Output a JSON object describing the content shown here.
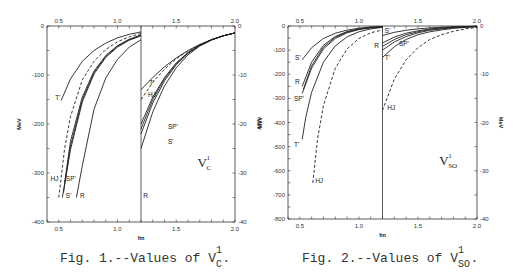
{
  "chart_data": [
    {
      "type": "line",
      "id": "fig1",
      "caption": {
        "prefix": "Fig. 1.--Values of V",
        "sup": "1",
        "sub": "C",
        "suffix": "."
      },
      "panel_label": {
        "main": "V",
        "sup": "1",
        "sub": "C"
      },
      "xlabel": "fm",
      "ylabel_left": "MeV",
      "ylabel_right": "MeV",
      "xlim": [
        0.4,
        2.0
      ],
      "x_break": 1.2,
      "ylim_left": [
        -400,
        0
      ],
      "ylim_right": [
        -40,
        0
      ],
      "x_ticks": [
        "0.5",
        "1.0",
        "1.5",
        "2.0"
      ],
      "x_tick_values": [
        0.5,
        1.0,
        1.5,
        2.0
      ],
      "y_ticks_left": [
        "0",
        "-100",
        "-200",
        "-300",
        "-400"
      ],
      "y_tick_values_left": [
        0,
        -100,
        -200,
        -300,
        -400
      ],
      "y_ticks_right": [
        "0",
        "-10",
        "-20",
        "-30",
        "-40"
      ],
      "y_tick_values_right": [
        0,
        -10,
        -20,
        -30,
        -40
      ],
      "series": [
        {
          "name": "T'",
          "style": "solid",
          "left": {
            "x": [
              0.52,
              0.6,
              0.7,
              0.8,
              0.9,
              1.0,
              1.1,
              1.2
            ],
            "y": [
              -152,
              -108,
              -72,
              -50,
              -35,
              -24,
              -17,
              -12
            ]
          },
          "right": {
            "x": [
              1.2,
              1.3,
              1.4,
              1.5,
              1.6,
              1.7,
              1.8,
              1.9,
              2.0
            ],
            "y": [
              -13,
              -10.5,
              -8.3,
              -6.5,
              -5,
              -3.8,
              -2.8,
              -2,
              -1.4
            ]
          }
        },
        {
          "name": "HJ",
          "style": "dashed",
          "left": {
            "x": [
              0.5,
              0.55,
              0.6,
              0.7,
              0.8,
              0.9,
              1.0,
              1.1,
              1.2
            ],
            "y": [
              -350,
              -250,
              -185,
              -110,
              -72,
              -48,
              -32,
              -22,
              -15
            ]
          },
          "right": {
            "x": [
              1.2,
              1.3,
              1.4,
              1.5,
              1.6,
              1.7,
              1.8,
              1.9,
              2.0
            ],
            "y": [
              -15,
              -11.5,
              -8.8,
              -6.7,
              -5.1,
              -3.8,
              -2.8,
              -2,
              -1.4
            ]
          }
        },
        {
          "name": "SP'",
          "style": "solid",
          "left": {
            "x": [
              0.55,
              0.6,
              0.7,
              0.8,
              0.9,
              1.0,
              1.1,
              1.2
            ],
            "y": [
              -320,
              -235,
              -145,
              -92,
              -60,
              -40,
              -27,
              -18
            ]
          },
          "right": {
            "x": [
              1.2,
              1.3,
              1.4,
              1.5,
              1.6,
              1.7,
              1.8,
              1.9,
              2.0
            ],
            "y": [
              -20,
              -14.5,
              -10.5,
              -7.5,
              -5.4,
              -3.9,
              -2.8,
              -2,
              -1.4
            ]
          }
        },
        {
          "name": "SP'-b",
          "style": "solid",
          "left": {
            "x": [
              0.54,
              0.6,
              0.7,
              0.8,
              0.9,
              1.0,
              1.1,
              1.2
            ],
            "y": [
              -340,
              -245,
              -150,
              -95,
              -62,
              -41,
              -28,
              -19
            ]
          },
          "right": {
            "x": [
              1.2,
              1.3,
              1.4,
              1.5,
              1.6,
              1.7,
              1.8,
              1.9,
              2.0
            ],
            "y": [
              -21,
              -15,
              -10.8,
              -7.7,
              -5.5,
              -3.9,
              -2.8,
              -2,
              -1.4
            ]
          }
        },
        {
          "name": "S'",
          "style": "solid",
          "left": {
            "x": [
              0.53,
              0.6,
              0.7,
              0.8,
              0.9,
              1.0,
              1.1,
              1.2
            ],
            "y": [
              -350,
              -252,
              -155,
              -98,
              -64,
              -43,
              -29,
              -20
            ]
          },
          "right": {
            "x": [
              1.2,
              1.3,
              1.4,
              1.5,
              1.6,
              1.7,
              1.8,
              1.9,
              2.0
            ],
            "y": [
              -22,
              -15.7,
              -11.2,
              -7.9,
              -5.6,
              -4,
              -2.8,
              -2,
              -1.4
            ]
          }
        },
        {
          "name": "R",
          "style": "solid",
          "left": {
            "x": [
              0.65,
              0.7,
              0.8,
              0.9,
              1.0,
              1.1,
              1.2
            ],
            "y": [
              -350,
              -285,
              -170,
              -106,
              -68,
              -43,
              -28
            ]
          },
          "right": {
            "x": [
              1.2,
              1.3,
              1.4,
              1.5,
              1.6,
              1.7,
              1.8,
              1.9,
              2.0
            ],
            "y": [
              -25,
              -17.5,
              -12.2,
              -8.5,
              -5.9,
              -4.1,
              -2.9,
              -2,
              -1.4
            ]
          }
        }
      ],
      "labels": [
        {
          "text": "T'",
          "panel": "left",
          "x": 0.47,
          "y": -150
        },
        {
          "text": "HJ",
          "panel": "left",
          "x": 0.43,
          "y": -316
        },
        {
          "text": "SP'",
          "panel": "left",
          "x": 0.56,
          "y": -316
        },
        {
          "text": "S'",
          "panel": "left",
          "x": 0.56,
          "y": -350
        },
        {
          "text": "R",
          "panel": "left",
          "x": 0.68,
          "y": -350
        },
        {
          "text": "T'",
          "panel": "right",
          "x": 1.27,
          "y": -12
        },
        {
          "text": "HJ",
          "panel": "right",
          "x": 1.26,
          "y": -14.5
        },
        {
          "text": "SP'",
          "panel": "right",
          "x": 1.43,
          "y": -21
        },
        {
          "text": "S'",
          "panel": "right",
          "x": 1.43,
          "y": -24
        },
        {
          "text": "R",
          "panel": "right",
          "x": 1.22,
          "y": -35
        }
      ]
    },
    {
      "type": "line",
      "id": "fig2",
      "caption": {
        "prefix": "Fig. 2.--Values of V",
        "sup": "1",
        "sub": "SO",
        "suffix": "."
      },
      "panel_label": {
        "main": "V",
        "sup": "1",
        "sub": "SO"
      },
      "xlabel": "fm",
      "ylabel_left": "MeV",
      "ylabel_right": "MeV",
      "xlim": [
        0.4,
        2.0
      ],
      "x_break": 1.2,
      "ylim_left": [
        -800,
        0
      ],
      "ylim_right": [
        -40,
        0
      ],
      "x_ticks": [
        "0.5",
        "1.0",
        "1.5",
        "2.0"
      ],
      "x_tick_values": [
        0.5,
        1.0,
        1.5,
        2.0
      ],
      "y_ticks_left": [
        "0",
        "-100",
        "-200",
        "-300",
        "-400",
        "-500",
        "-600",
        "-700",
        "-800"
      ],
      "y_tick_values_left": [
        0,
        -100,
        -200,
        -300,
        -400,
        -500,
        -600,
        -700,
        -800
      ],
      "y_ticks_right": [
        "0",
        "-10",
        "-20",
        "-30",
        "-40"
      ],
      "y_tick_values_right": [
        0,
        -10,
        -20,
        -30,
        -40
      ],
      "series": [
        {
          "name": "S'",
          "style": "solid",
          "left": {
            "x": [
              0.52,
              0.6,
              0.7,
              0.8,
              0.9,
              1.0,
              1.1,
              1.2
            ],
            "y": [
              -140,
              -90,
              -52,
              -30,
              -17,
              -9,
              -4,
              -2
            ]
          },
          "right": {
            "x": [
              1.2,
              1.3,
              1.4,
              1.5,
              1.6,
              1.7,
              1.8,
              1.9,
              2.0
            ],
            "y": [
              -2,
              -1.3,
              -0.9,
              -0.6,
              -0.4,
              -0.25,
              -0.15,
              -0.1,
              -0.05
            ]
          }
        },
        {
          "name": "R",
          "style": "solid",
          "left": {
            "x": [
              0.52,
              0.6,
              0.7,
              0.8,
              0.9,
              1.0,
              1.1,
              1.2
            ],
            "y": [
              -250,
              -150,
              -80,
              -43,
              -23,
              -12,
              -6,
              -3
            ]
          },
          "right": {
            "x": [
              1.2,
              1.3,
              1.4,
              1.5,
              1.6,
              1.7,
              1.8,
              1.9,
              2.0
            ],
            "y": [
              -3.5,
              -2.3,
              -1.5,
              -1,
              -0.6,
              -0.4,
              -0.25,
              -0.15,
              -0.08
            ]
          }
        },
        {
          "name": "R-b",
          "style": "solid",
          "left": {
            "x": [
              0.53,
              0.6,
              0.7,
              0.8,
              0.9,
              1.0,
              1.1,
              1.2
            ],
            "y": [
              -262,
              -165,
              -88,
              -47,
              -25,
              -13,
              -7,
              -3.5
            ]
          },
          "right": {
            "x": [
              1.2,
              1.3,
              1.4,
              1.5,
              1.6,
              1.7,
              1.8,
              1.9,
              2.0
            ],
            "y": [
              -4.2,
              -2.8,
              -1.8,
              -1.2,
              -0.75,
              -0.5,
              -0.3,
              -0.18,
              -0.1
            ]
          }
        },
        {
          "name": "SP'",
          "style": "solid",
          "left": {
            "x": [
              0.52,
              0.6,
              0.7,
              0.8,
              0.9,
              1.0,
              1.1,
              1.2
            ],
            "y": [
              -280,
              -175,
              -95,
              -52,
              -28,
              -15,
              -8,
              -4
            ]
          },
          "right": {
            "x": [
              1.2,
              1.3,
              1.4,
              1.5,
              1.6,
              1.7,
              1.8,
              1.9,
              2.0
            ],
            "y": [
              -5,
              -3.3,
              -2.2,
              -1.4,
              -0.9,
              -0.6,
              -0.35,
              -0.2,
              -0.1
            ]
          }
        },
        {
          "name": "T'",
          "style": "solid",
          "left": {
            "x": [
              0.52,
              0.55,
              0.6,
              0.7,
              0.8,
              0.9,
              1.0,
              1.1,
              1.2
            ],
            "y": [
              -470,
              -380,
              -275,
              -150,
              -82,
              -45,
              -24,
              -12,
              -6
            ]
          },
          "right": {
            "x": [
              1.2,
              1.3,
              1.4,
              1.5,
              1.6,
              1.7,
              1.8,
              1.9,
              2.0
            ],
            "y": [
              -6.5,
              -4.3,
              -2.8,
              -1.8,
              -1.2,
              -0.8,
              -0.5,
              -0.3,
              -0.15
            ]
          }
        },
        {
          "name": "HJ",
          "style": "dashed",
          "left": {
            "x": [
              0.61,
              0.65,
              0.7,
              0.8,
              0.9,
              1.0,
              1.1,
              1.2
            ],
            "y": [
              -650,
              -470,
              -330,
              -175,
              -95,
              -52,
              -28,
              -16
            ]
          },
          "right": {
            "x": [
              1.2,
              1.3,
              1.4,
              1.5,
              1.6,
              1.7,
              1.8,
              1.9,
              2.0
            ],
            "y": [
              -17.5,
              -11,
              -7,
              -4.5,
              -2.8,
              -1.8,
              -1.1,
              -0.6,
              -0.3
            ]
          }
        }
      ],
      "labels": [
        {
          "text": "S'",
          "panel": "left",
          "x": 0.46,
          "y": -140
        },
        {
          "text": "R",
          "panel": "left",
          "x": 0.46,
          "y": -240
        },
        {
          "text": "SP'",
          "panel": "left",
          "x": 0.45,
          "y": -310
        },
        {
          "text": "T'",
          "panel": "left",
          "x": 0.45,
          "y": -500
        },
        {
          "text": "HJ",
          "panel": "left",
          "x": 0.63,
          "y": -650
        },
        {
          "text": "S'",
          "panel": "right",
          "x": 1.22,
          "y": -1.5
        },
        {
          "text": "R",
          "panel": "right",
          "x": 1.13,
          "y": -4.5
        },
        {
          "text": "SP'",
          "panel": "right",
          "x": 1.34,
          "y": -4.2
        },
        {
          "text": "T'",
          "panel": "right",
          "x": 1.22,
          "y": -7
        },
        {
          "text": "HJ",
          "panel": "right",
          "x": 1.24,
          "y": -17.5
        }
      ]
    }
  ]
}
